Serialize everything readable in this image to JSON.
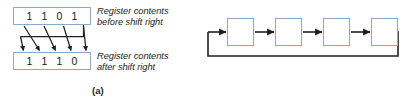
{
  "figure": {
    "panels": [
      {
        "id": "a",
        "label": "(a)",
        "registers": [
          {
            "name": "register-before",
            "bits": [
              "1",
              "1",
              "0",
              "1"
            ],
            "caption": "Register contents\nbefore shift right"
          },
          {
            "name": "register-after",
            "bits": [
              "1",
              "1",
              "1",
              "0"
            ],
            "caption": "Register contents\nafter shift right"
          }
        ],
        "shift_direction": "right",
        "shift_type": "circular",
        "arrow_count": 4,
        "wrap_arrow": true
      },
      {
        "id": "b",
        "label": "(b)",
        "stage_count": 4,
        "stages": [
          "",
          "",
          "",
          ""
        ],
        "connector_arrows": 3,
        "input_arrow": true,
        "feedback_loop": true
      }
    ],
    "colors": {
      "box_border": "#8aa9c8",
      "box_fill": "#ffffff",
      "wire": "#231f20",
      "text": "#231f20",
      "background": "#ffffff"
    }
  }
}
